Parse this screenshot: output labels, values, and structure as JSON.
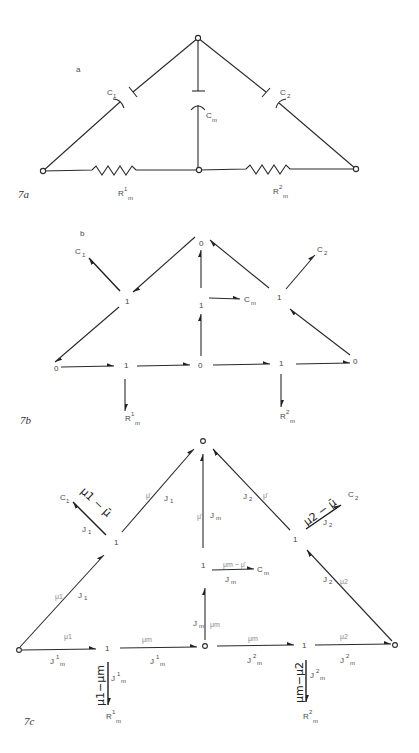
{
  "figure": {
    "panels": [
      {
        "id": "7a",
        "caption": "7a",
        "letter": "a",
        "labels": {
          "c1": "C",
          "c1_sub": "1",
          "cm": "C",
          "cm_sub": "m",
          "c2": "C",
          "c2_sub": "2",
          "r1": "R",
          "r1_sup": "1",
          "r1_sub": "m",
          "r2": "R",
          "r2_sup": "2",
          "r2_sub": "m"
        }
      },
      {
        "id": "7b",
        "caption": "7b",
        "letter": "b",
        "junctions": {
          "top": "0",
          "left_mid": "1",
          "center_mid": "1",
          "right_mid": "1",
          "bottom_left": "0",
          "bottom_1": "1",
          "bottom_center": "0",
          "bottom_2": "1",
          "bottom_right": "0"
        },
        "labels": {
          "c1": "C",
          "c1_sub": "1",
          "c2": "C",
          "c2_sub": "2",
          "cm": "C",
          "cm_sub": "m",
          "r1": "R",
          "r1_sup": "1",
          "r1_sub": "m",
          "r2": "R",
          "r2_sup": "2",
          "r2_sub": "m"
        }
      },
      {
        "id": "7c",
        "caption": "7c",
        "junctions": {
          "left_mid": "1",
          "center_mid": "1",
          "right_mid": "1",
          "bottom_1": "1",
          "bottom_2": "1"
        },
        "labels": {
          "c1": "C",
          "c1_sub": "1",
          "c2": "C",
          "c2_sub": "2",
          "cm": "C",
          "cm_sub": "m",
          "r1": "R",
          "r1_sup": "1",
          "r1_sub": "m",
          "r2": "R",
          "r2_sup": "2",
          "r2_sub": "m",
          "effort_mu1_minus_mubar": "μ1 − μ̄",
          "effort_mu2_minus_mubar": "μ2 − μ̄",
          "effort_mum_minus_mubar": "μm − μ̄",
          "effort_mu1_minus_mum": "μ1−μm",
          "effort_mum_minus_mu2": "μm−μ2",
          "mubar": "μ̄",
          "mu1": "μ1",
          "mu2": "μ2",
          "mum": "μm",
          "J1": "J",
          "J1_sub": "1",
          "J2": "J",
          "J2_sub": "2",
          "Jm": "J",
          "Jm_sub": "m",
          "Jm1": "J",
          "Jm1_sup": "1",
          "Jm1_sub": "m",
          "Jm2": "J",
          "Jm2_sup": "2",
          "Jm2_sub": "m"
        }
      }
    ]
  }
}
